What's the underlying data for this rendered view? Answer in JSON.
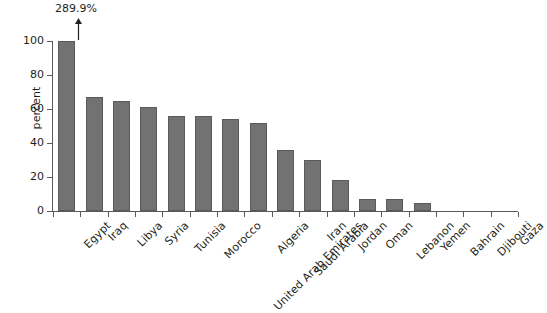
{
  "chart_data": {
    "type": "bar",
    "title": "",
    "subtitle": "",
    "xlabel": "",
    "ylabel": "percent",
    "ylim": [
      0,
      100
    ],
    "yticks": [
      0,
      20,
      40,
      60,
      80,
      100
    ],
    "grid": false,
    "legend": null,
    "categories": [
      "Egypt",
      "Iraq",
      "Libya",
      "Syria",
      "Tunisia",
      "Morocco",
      "United Arab Emirates",
      "Algeria",
      "Saudi Arabia",
      "Iran",
      "Jordan",
      "Oman",
      "Lebanon",
      "Yemen",
      "Bahrain",
      "Djibouti",
      "Gaza"
    ],
    "values": [
      289.9,
      67,
      65,
      61,
      56,
      56,
      54,
      52,
      36,
      30,
      18,
      7,
      7,
      5,
      0,
      0,
      0
    ],
    "display_values": [
      100,
      67,
      65,
      61,
      56,
      56,
      54,
      52,
      36,
      30,
      18,
      7,
      7,
      5,
      0,
      0,
      0
    ],
    "annotations": [
      {
        "category": "Egypt",
        "label": "289.9%",
        "marker": "up-arrow",
        "note": "bar clipped at axis maximum"
      }
    ],
    "bar_color": "#727272",
    "bar_edge_color": "#5a5a5a",
    "axis_color": "#58595b",
    "background_color": "#ffffff",
    "text_color": "#231f20"
  },
  "axis": {
    "y_title": "percent",
    "y_tick_labels": [
      "0",
      "20",
      "40",
      "60",
      "80",
      "100"
    ]
  },
  "annotation": {
    "overflow_label": "289.9%"
  }
}
